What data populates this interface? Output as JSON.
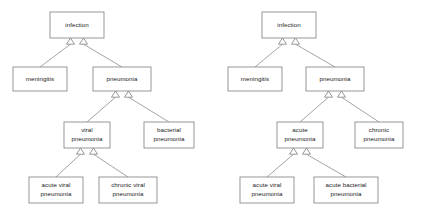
{
  "figure": {
    "kind": "uml-generalization-diagrams",
    "background_color": "#ffffff",
    "box_fill": "#ffffff",
    "box_stroke": "#8c8c8c",
    "edge_stroke": "#9a9a9a",
    "text_color": "#1a1a1a"
  },
  "diagrams": [
    {
      "id": "left-diagram",
      "name": "viral-bacterial-pneumonia-hierarchy",
      "nodes": [
        {
          "id": "l-infection",
          "label_lines": [
            "infection"
          ],
          "x": 50,
          "y": 12,
          "w": 54,
          "h": 26
        },
        {
          "id": "l-meningitis",
          "label_lines": [
            "meningitis"
          ],
          "x": 13,
          "y": 67,
          "w": 54,
          "h": 24
        },
        {
          "id": "l-pneumonia",
          "label_lines": [
            "pneumonia"
          ],
          "x": 93,
          "y": 67,
          "w": 58,
          "h": 24
        },
        {
          "id": "l-viral-pneumonia",
          "label_lines": [
            "viral",
            "pneumonia"
          ],
          "x": 64,
          "y": 122,
          "w": 46,
          "h": 26
        },
        {
          "id": "l-bacterial-pneumonia",
          "label_lines": [
            "bacterial",
            "pneumonia"
          ],
          "x": 144,
          "y": 122,
          "w": 50,
          "h": 26
        },
        {
          "id": "l-acute-viral",
          "label_lines": [
            "acute viral",
            "pneumonia"
          ],
          "x": 29,
          "y": 177,
          "w": 54,
          "h": 26
        },
        {
          "id": "l-chronic-viral",
          "label_lines": [
            "chronic viral",
            "pneumonia"
          ],
          "x": 99,
          "y": 177,
          "w": 58,
          "h": 26
        }
      ],
      "edges": [
        {
          "id": "l-e1",
          "from": "l-meningitis",
          "to": "l-infection",
          "relation": "generalization"
        },
        {
          "id": "l-e2",
          "from": "l-pneumonia",
          "to": "l-infection",
          "relation": "generalization"
        },
        {
          "id": "l-e3",
          "from": "l-viral-pneumonia",
          "to": "l-pneumonia",
          "relation": "generalization"
        },
        {
          "id": "l-e4",
          "from": "l-bacterial-pneumonia",
          "to": "l-pneumonia",
          "relation": "generalization"
        },
        {
          "id": "l-e5",
          "from": "l-acute-viral",
          "to": "l-viral-pneumonia",
          "relation": "generalization"
        },
        {
          "id": "l-e6",
          "from": "l-chronic-viral",
          "to": "l-viral-pneumonia",
          "relation": "generalization"
        }
      ]
    },
    {
      "id": "right-diagram",
      "name": "acute-chronic-pneumonia-hierarchy",
      "nodes": [
        {
          "id": "r-infection",
          "label_lines": [
            "infection"
          ],
          "x": 262,
          "y": 12,
          "w": 54,
          "h": 26
        },
        {
          "id": "r-meningitis",
          "label_lines": [
            "meningitis"
          ],
          "x": 228,
          "y": 67,
          "w": 54,
          "h": 24
        },
        {
          "id": "r-pneumonia",
          "label_lines": [
            "pneumonia"
          ],
          "x": 306,
          "y": 67,
          "w": 58,
          "h": 24
        },
        {
          "id": "r-acute-pneumonia",
          "label_lines": [
            "acute",
            "pneumonia"
          ],
          "x": 277,
          "y": 122,
          "w": 46,
          "h": 26
        },
        {
          "id": "r-chronic-pneumonia",
          "label_lines": [
            "chronic",
            "pneumonia"
          ],
          "x": 355,
          "y": 122,
          "w": 48,
          "h": 26
        },
        {
          "id": "r-acute-viral",
          "label_lines": [
            "acute viral",
            "pneumonia"
          ],
          "x": 240,
          "y": 177,
          "w": 54,
          "h": 26
        },
        {
          "id": "r-acute-bacterial",
          "label_lines": [
            "acute bacterial",
            "pneumonia"
          ],
          "x": 314,
          "y": 177,
          "w": 64,
          "h": 26
        }
      ],
      "edges": [
        {
          "id": "r-e1",
          "from": "r-meningitis",
          "to": "r-infection",
          "relation": "generalization"
        },
        {
          "id": "r-e2",
          "from": "r-pneumonia",
          "to": "r-infection",
          "relation": "generalization"
        },
        {
          "id": "r-e3",
          "from": "r-acute-pneumonia",
          "to": "r-pneumonia",
          "relation": "generalization"
        },
        {
          "id": "r-e4",
          "from": "r-chronic-pneumonia",
          "to": "r-pneumonia",
          "relation": "generalization"
        },
        {
          "id": "r-e5",
          "from": "r-acute-viral",
          "to": "r-acute-pneumonia",
          "relation": "generalization"
        },
        {
          "id": "r-e6",
          "from": "r-acute-bacterial",
          "to": "r-acute-pneumonia",
          "relation": "generalization"
        }
      ]
    }
  ]
}
